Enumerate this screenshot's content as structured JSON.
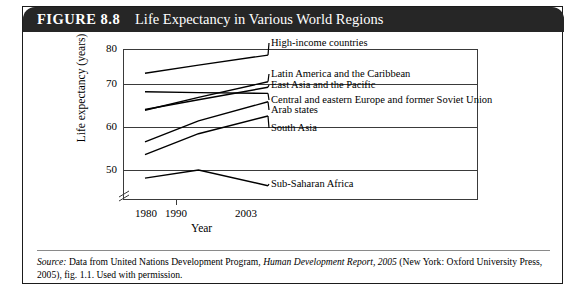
{
  "figure": {
    "number": "FIGURE 8.8",
    "title": "Life Expectancy in Various World Regions"
  },
  "source_note": {
    "label": "Source:",
    "text_1": " Data from United Nations Development Program, ",
    "italic_1": "Human Development Report, 2005",
    "text_2": " (New York: Oxford University Press, 2005), fig. 1.1. Used with permission."
  },
  "chart_data": {
    "type": "line",
    "title": "Life Expectancy in Various World Regions",
    "xlabel": "Year",
    "ylabel": "Life expectancy (years)",
    "x": [
      1980,
      1990,
      2003
    ],
    "xtick_labels": [
      "1980",
      "1990",
      "2003"
    ],
    "ytick_labels": [
      "50",
      "60",
      "70",
      "80"
    ],
    "yticks": [
      50,
      60,
      70,
      80
    ],
    "ylim": [
      45,
      80
    ],
    "xlim": [
      1980,
      2003
    ],
    "axis_break": true,
    "grid": true,
    "legend": "inline-labels",
    "series": [
      {
        "name": "High-income countries",
        "values": [
          74.0,
          76.0,
          78.5
        ]
      },
      {
        "name": "Latin America and the Caribbean",
        "values": [
          64.8,
          68.0,
          71.9
        ]
      },
      {
        "name": "East Asia and the Pacific",
        "values": [
          65.0,
          67.4,
          70.5
        ]
      },
      {
        "name": "Central and eastern Europe and former Soviet Union",
        "values": [
          69.4,
          69.2,
          69.0
        ]
      },
      {
        "name": "Arab states",
        "values": [
          57.0,
          62.2,
          66.9
        ]
      },
      {
        "name": "South Asia",
        "values": [
          53.8,
          59.0,
          63.4
        ]
      },
      {
        "name": "Sub-Saharan Africa",
        "values": [
          48.0,
          50.0,
          46.1
        ]
      }
    ]
  },
  "axis": {
    "y_title": "Life expectancy (years)",
    "x_title": "Year",
    "yticks": [
      "80",
      "70",
      "60",
      "50"
    ],
    "xticks": [
      "1980",
      "1990",
      "2003"
    ]
  },
  "labels": {
    "high_income": "High-income countries",
    "latin_america": "Latin America and the Caribbean",
    "east_asia": "East Asia and the Pacific",
    "central_eastern_europe": "Central and eastern Europe and former Soviet Union",
    "arab_states": "Arab states",
    "south_asia": "South Asia",
    "sub_saharan": "Sub-Saharan Africa"
  }
}
